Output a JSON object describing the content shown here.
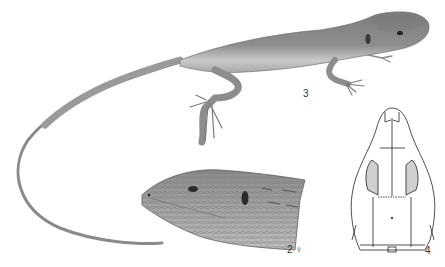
{
  "plate": {
    "background": "#ffffff",
    "figures": [
      {
        "id": "3",
        "label": "3",
        "description": "lizard full body, lateral view",
        "body_color": "#8a8a8a"
      },
      {
        "id": "2",
        "label": "2 ♀",
        "description": "head of female, lateral view",
        "body_color": "#9a9a9a"
      },
      {
        "id": "4",
        "label": "4",
        "description": "skull, dorsal view (line drawing)",
        "stroke_color": "#222222"
      }
    ]
  }
}
